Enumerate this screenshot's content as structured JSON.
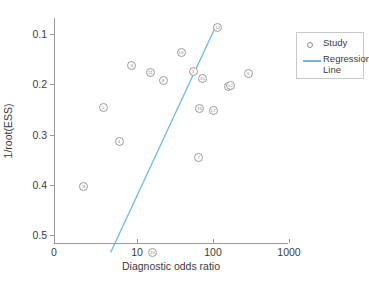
{
  "chart_data": {
    "type": "scatter",
    "title": "",
    "xlabel": "Diagnostic odds ratio",
    "ylabel": "1/root(ESS)",
    "xscale": "log",
    "xticks": [
      0,
      10,
      100,
      1000
    ],
    "xtick_labels": [
      "0",
      "10",
      "100",
      "1000"
    ],
    "yticks": [
      0.1,
      0.2,
      0.3,
      0.4,
      0.5
    ],
    "ytick_labels": [
      "0.1",
      "0.2",
      "0.3",
      "0.4",
      "0.5"
    ],
    "ylim": [
      0.54,
      0.07
    ],
    "y_inverted": true,
    "grid": false,
    "legend_position": "upper right",
    "legend": [
      {
        "label": "Study",
        "marker": "circle"
      },
      {
        "label": "Regression Line",
        "marker": "line",
        "color": "#6bb8e8"
      }
    ],
    "series": [
      {
        "name": "Study",
        "marker": "numbered-circle",
        "points": [
          {
            "id": "1",
            "x": 55,
            "y": 0.175
          },
          {
            "id": "2",
            "x": 3.6,
            "y": 0.247
          },
          {
            "id": "3",
            "x": 8.5,
            "y": 0.163
          },
          {
            "id": "4",
            "x": 5.8,
            "y": 0.313
          },
          {
            "id": "5",
            "x": 160,
            "y": 0.205
          },
          {
            "id": "6",
            "x": 290,
            "y": 0.178
          },
          {
            "id": "7",
            "x": 65,
            "y": 0.345
          },
          {
            "id": "8",
            "x": 22,
            "y": 0.193
          },
          {
            "id": "9",
            "x": 2.0,
            "y": 0.403
          },
          {
            "id": "10",
            "x": 16,
            "y": 0.535
          },
          {
            "id": "11",
            "x": 15,
            "y": 0.176
          },
          {
            "id": "12",
            "x": 170,
            "y": 0.202
          },
          {
            "id": "13",
            "x": 38,
            "y": 0.137
          },
          {
            "id": "14",
            "x": 115,
            "y": 0.088
          },
          {
            "id": "15",
            "x": 72,
            "y": 0.188
          },
          {
            "id": "16",
            "x": 67,
            "y": 0.248
          },
          {
            "id": "17",
            "x": 100,
            "y": 0.252
          }
        ]
      }
    ],
    "regression_line": {
      "color": "#6bb8e8",
      "x_start": 4.5,
      "y_start": 0.535,
      "x_end": 110,
      "y_end": 0.083
    }
  },
  "caption": "",
  "colors": {
    "axis": "#9a9a9a",
    "marker_edge": "#9b9b9b",
    "line": "#6bb8e8",
    "text": "#3b3b3b"
  }
}
